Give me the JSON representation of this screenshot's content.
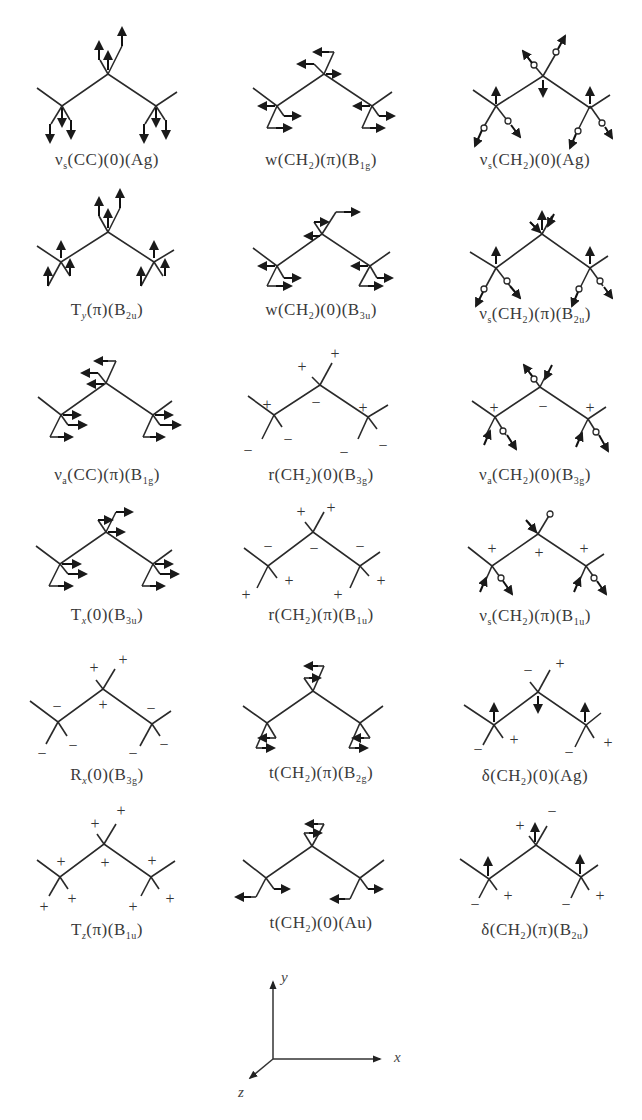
{
  "figure": {
    "modes": [
      {
        "row": 0,
        "col": 0,
        "symbol": "νs",
        "sym_sub": "s",
        "group": "CC",
        "phase": "0",
        "species": "Ag",
        "species_main": "A",
        "species_sub": "g",
        "label": "νs(CC)(0)(Ag)",
        "display": "type-arrows-vertical"
      },
      {
        "row": 0,
        "col": 1,
        "symbol": "w",
        "group": "CH2",
        "phase": "π",
        "species": "B1g",
        "label": "w(CH2)(π)(B1g)",
        "display": "type-arrows-horizontal"
      },
      {
        "row": 0,
        "col": 2,
        "symbol": "νs",
        "group": "CH2",
        "phase": "0",
        "species": "Ag",
        "label": "νs(CH2)(0)(Ag)",
        "display": "type-hydrogen-stretch"
      },
      {
        "row": 1,
        "col": 0,
        "symbol": "Ty",
        "group": "",
        "phase": "π",
        "species": "B2u",
        "label": "Ty(π)(B2u)",
        "display": "type-arrows-vertical"
      },
      {
        "row": 1,
        "col": 1,
        "symbol": "w",
        "group": "CH2",
        "phase": "0",
        "species": "B3u",
        "label": "w(CH2)(0)(B3u)",
        "display": "type-arrows-horizontal"
      },
      {
        "row": 1,
        "col": 2,
        "symbol": "νs",
        "group": "CH2",
        "phase": "π",
        "species": "B2u",
        "label": "νs(CH2)(π)(B2u)",
        "display": "type-hydrogen-stretch"
      },
      {
        "row": 2,
        "col": 0,
        "symbol": "νa",
        "group": "CC",
        "phase": "π",
        "species": "B1g",
        "label": "νa(CC)(π)(B1g)",
        "display": "type-arrows-horizontal"
      },
      {
        "row": 2,
        "col": 1,
        "symbol": "r",
        "group": "CH2",
        "phase": "0",
        "species": "B3g",
        "label": "r(CH2)(0)(B3g)",
        "display": "type-signs",
        "signs": {
          "center_top_left": "+",
          "center_top_right": "+",
          "center_below": "−",
          "left_above": "+",
          "left_below_left": "−",
          "left_below_right": "−",
          "right_above": "+",
          "right_below_left": "−",
          "right_below_right": "−"
        }
      },
      {
        "row": 2,
        "col": 2,
        "symbol": "νa",
        "group": "CH2",
        "phase": "0",
        "species": "B3g",
        "label": "νa(CH2)(0)(B3g)",
        "display": "type-hydrogen-stretch-signs",
        "signs": {
          "left_above": "+",
          "center_below": "−",
          "right_above": "+"
        }
      },
      {
        "row": 3,
        "col": 0,
        "symbol": "Tx",
        "group": "",
        "phase": "0",
        "species": "B3u",
        "label": "Tx(0)(B3u)",
        "display": "type-arrows-horizontal"
      },
      {
        "row": 3,
        "col": 1,
        "symbol": "r",
        "group": "CH2",
        "phase": "π",
        "species": "B1u",
        "label": "r(CH2)(π)(B1u)",
        "display": "type-signs",
        "signs": {
          "center_top_left": "+",
          "center_top_right": "+",
          "center_below": "−",
          "left_above": "−",
          "left_below_left": "+",
          "left_below_right": "+",
          "right_above": "−",
          "right_below_left": "+",
          "right_below_right": "+"
        }
      },
      {
        "row": 3,
        "col": 2,
        "symbol": "νs",
        "group": "CH2",
        "phase": "π",
        "species": "B1u",
        "label": "νs(CH2)(π)(B1u)",
        "display": "type-hydrogen-stretch-signs",
        "signs": {
          "left_above": "+",
          "center_below": "+",
          "right_above": "+"
        }
      },
      {
        "row": 4,
        "col": 0,
        "symbol": "Rx",
        "group": "",
        "phase": "0",
        "species": "B3g",
        "label": "Rx(0)(B3g)",
        "display": "type-signs",
        "signs": {
          "center_top_left": "+",
          "center_top_right": "+",
          "center_below": "+",
          "left_above": "−",
          "left_below_left": "−",
          "left_below_right": "−",
          "right_above": "−",
          "right_below_left": "−",
          "right_below_right": "−"
        }
      },
      {
        "row": 4,
        "col": 1,
        "symbol": "t",
        "group": "CH2",
        "phase": "π",
        "species": "B2g",
        "label": "t(CH2)(π)(B2g)",
        "display": "type-twist"
      },
      {
        "row": 4,
        "col": 2,
        "symbol": "δ",
        "group": "CH2",
        "phase": "0",
        "species": "Ag",
        "label": "δ(CH2)(0)(Ag)",
        "display": "type-bend-signs",
        "signs": {
          "center_top_left": "−",
          "center_top_right": "+",
          "left_below_left": "−",
          "left_below_right": "+",
          "right_below_left": "−",
          "right_below_right": "+"
        }
      },
      {
        "row": 5,
        "col": 0,
        "symbol": "Tz",
        "group": "",
        "phase": "π",
        "species": "B1u",
        "label": "Tz(π)(B1u)",
        "display": "type-signs",
        "signs": {
          "center_top_left": "+",
          "center_top_right": "+",
          "center_below": "+",
          "left_above": "+",
          "left_below_left": "+",
          "left_below_right": "+",
          "right_above": "+",
          "right_below_left": "+",
          "right_below_right": "+"
        }
      },
      {
        "row": 5,
        "col": 1,
        "symbol": "t",
        "group": "CH2",
        "phase": "0",
        "species": "Au",
        "label": "t(CH2)(0)(Au)",
        "display": "type-twist"
      },
      {
        "row": 5,
        "col": 2,
        "symbol": "δ",
        "group": "CH2",
        "phase": "π",
        "species": "B2u",
        "label": "δ(CH2)(π)(B2u)",
        "display": "type-bend-signs",
        "signs": {
          "center_top_left": "+",
          "center_top_right": "−",
          "left_below_left": "−",
          "left_below_right": "+",
          "right_below_left": "−",
          "right_below_right": "+"
        }
      }
    ],
    "axes": {
      "x": "x",
      "y": "y",
      "z": "z"
    }
  },
  "labels": {
    "m0": {
      "pre": "ν",
      "sub1": "s",
      "mid": "(CC)(0)(Ag)",
      "sub2": "",
      "post": ""
    },
    "m1": {
      "pre": "w(CH",
      "sub1": "2",
      "mid": ")(π)(B",
      "sub2": "1g",
      "post": ")"
    },
    "m2": {
      "pre": "ν",
      "sub1": "s",
      "mid": "(CH",
      "sub2": "2",
      "post": ")(0)(Ag)"
    },
    "m3": {
      "pre": "T",
      "sub1": "y",
      "mid": "(π)(B",
      "sub2": "2u",
      "post": ")"
    },
    "m4": {
      "pre": "w(CH",
      "sub1": "2",
      "mid": ")(0)(B",
      "sub2": "3u",
      "post": ")"
    },
    "m5": {
      "pre": "ν",
      "sub1": "s",
      "mid": "(CH",
      "sub2": "2",
      "post": ")(π)(B",
      "sub3": "2u",
      "post2": ")"
    },
    "m6": {
      "pre": "ν",
      "sub1": "a",
      "mid": "(CC)(π)(B",
      "sub2": "1g",
      "post": ")"
    },
    "m7": {
      "pre": "r(CH",
      "sub1": "2",
      "mid": ")(0)(B",
      "sub2": "3g",
      "post": ")"
    },
    "m8": {
      "pre": "ν",
      "sub1": "a",
      "mid": "(CH",
      "sub2": "2",
      "post": ")(0)(B",
      "sub3": "3g",
      "post2": ")"
    },
    "m9": {
      "pre": "T",
      "sub1": "x",
      "mid": "(0)(B",
      "sub2": "3u",
      "post": ")"
    },
    "m10": {
      "pre": "r(CH",
      "sub1": "2",
      "mid": ")(π)(B",
      "sub2": "1u",
      "post": ")"
    },
    "m11": {
      "pre": "ν",
      "sub1": "s",
      "mid": "(CH",
      "sub2": "2",
      "post": ")(π)(B",
      "sub3": "1u",
      "post2": ")"
    },
    "m12": {
      "pre": "R",
      "sub1": "x",
      "mid": "(0)(B",
      "sub2": "3g",
      "post": ")"
    },
    "m13": {
      "pre": "t(CH",
      "sub1": "2",
      "mid": ")(π)(B",
      "sub2": "2g",
      "post": ")"
    },
    "m14": {
      "pre": "δ(CH",
      "sub1": "2",
      "mid": ")(0)(Ag)",
      "sub2": "",
      "post": ""
    },
    "m15": {
      "pre": "T",
      "sub1": "z",
      "mid": "(π)(B",
      "sub2": "1u",
      "post": ")"
    },
    "m16": {
      "pre": "t(CH",
      "sub1": "2",
      "mid": ")(0)(Au)",
      "sub2": "",
      "post": ""
    },
    "m17": {
      "pre": "δ(CH",
      "sub1": "2",
      "mid": ")(π)(B",
      "sub2": "2u",
      "post": ")"
    }
  },
  "axes": {
    "x_label": "x",
    "y_label": "y",
    "z_label": "z"
  },
  "colors": {
    "line": "#2a2a2a",
    "text": "#3a3a3a",
    "background": "#ffffff"
  }
}
